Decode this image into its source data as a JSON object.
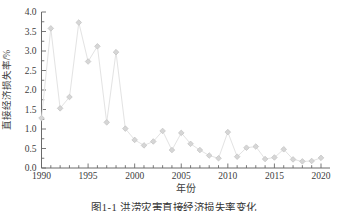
{
  "figure": {
    "caption": "图1-1  洪涝灾害直接经济损失率变化"
  },
  "chart_data": {
    "type": "line",
    "series_name": "直接经济损失率",
    "x": [
      1990,
      1991,
      1992,
      1993,
      1994,
      1995,
      1996,
      1997,
      1998,
      1999,
      2000,
      2001,
      2002,
      2003,
      2004,
      2005,
      2006,
      2007,
      2008,
      2009,
      2010,
      2011,
      2012,
      2013,
      2014,
      2015,
      2016,
      2017,
      2018,
      2019,
      2020
    ],
    "values": [
      1.28,
      3.58,
      1.53,
      1.82,
      3.73,
      2.73,
      3.12,
      1.17,
      2.97,
      1.01,
      0.72,
      0.58,
      0.68,
      0.95,
      0.46,
      0.9,
      0.62,
      0.46,
      0.32,
      0.25,
      0.92,
      0.29,
      0.52,
      0.55,
      0.23,
      0.27,
      0.48,
      0.22,
      0.17,
      0.18,
      0.26
    ],
    "title": "",
    "xlabel": "年份",
    "ylabel": "直接经济损失率/%",
    "xlim": [
      1990,
      2020
    ],
    "ylim": [
      0.0,
      4.0
    ],
    "x_major_ticks": [
      "1990",
      "1995",
      "2000",
      "2005",
      "2010",
      "2015",
      "2020"
    ],
    "y_major_ticks": [
      "0.0",
      "0.5",
      "1.0",
      "1.5",
      "2.0",
      "2.5",
      "3.0",
      "3.5",
      "4.0"
    ],
    "x_minor_step": 1,
    "y_minor_step": 0.25,
    "grid": false,
    "legend_position": "none",
    "marker": "diamond",
    "colors": {
      "line": "#e3e3e3",
      "marker_fill": "#d6d6d6",
      "marker_stroke": "#c2c2c2",
      "axis": "#6a6a6a",
      "tick_text": "#3d3d3d"
    }
  }
}
